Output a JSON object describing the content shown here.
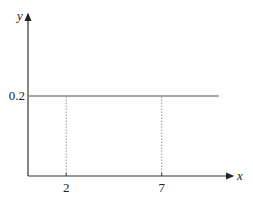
{
  "chart_data": {
    "type": "line",
    "title": "",
    "xlabel": "x",
    "ylabel": "y",
    "x_ticks": [
      "2",
      "7"
    ],
    "y_ticks": [
      "0.2"
    ],
    "series": [
      {
        "name": "uniform density f(x)",
        "x": [
          0,
          10
        ],
        "y": [
          0.2,
          0.2
        ]
      }
    ],
    "reference_lines": [
      {
        "orientation": "vertical",
        "x": 2,
        "style": "dashed",
        "from_y": 0,
        "to_y": 0.2
      },
      {
        "orientation": "vertical",
        "x": 7,
        "style": "dashed",
        "from_y": 0,
        "to_y": 0.2
      }
    ],
    "xlim": [
      0,
      10
    ],
    "ylim": [
      0,
      0.4
    ],
    "grid": false,
    "colors": {
      "axis": "#333333",
      "line": "#888888",
      "dashed": "#999999"
    }
  }
}
